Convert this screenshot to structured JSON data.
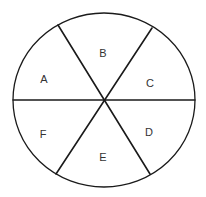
{
  "diagram": {
    "type": "circle-divided-into-six-segments",
    "stroke_color": "#1a1a1a",
    "label_color": "#333333",
    "background": "#ffffff",
    "circle": {
      "cx": 104,
      "cy": 100,
      "rx": 91,
      "ry": 87
    },
    "lines": [
      {
        "id": "horizontal",
        "x1": 13,
        "y1": 100,
        "x2": 195,
        "y2": 100
      },
      {
        "id": "diag-upper-left-to-lower-right",
        "x1": 58,
        "y1": 25,
        "x2": 150,
        "y2": 174
      },
      {
        "id": "diag-upper-right-to-lower-left",
        "x1": 152,
        "y1": 28,
        "x2": 56,
        "y2": 174
      }
    ],
    "segments": [
      {
        "label": "A",
        "x": 44,
        "y": 79
      },
      {
        "label": "B",
        "x": 103,
        "y": 53
      },
      {
        "label": "C",
        "x": 150,
        "y": 83
      },
      {
        "label": "D",
        "x": 149,
        "y": 132
      },
      {
        "label": "E",
        "x": 103,
        "y": 157
      },
      {
        "label": "F",
        "x": 43,
        "y": 134
      }
    ]
  }
}
